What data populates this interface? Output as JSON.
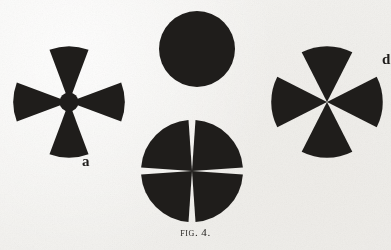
{
  "plate": {
    "caption_prefix": "Fig.",
    "caption_number": "4.",
    "caption_full": "FIG. 4.",
    "background_color": "#f2f1ee",
    "ink_color": "#1f1d1b"
  },
  "figures": [
    {
      "id": "a",
      "label": "a",
      "name": "four-sector-narrow-cross",
      "description": "Maltese-cross figure of four narrow circular sectors on the vertical and horizontal axes",
      "sector_count": 4,
      "sector_angle_deg": 40,
      "orientation_deg": 0,
      "center_x": 69,
      "center_y": 102,
      "radius": 54,
      "fill": "#1f1d1b"
    },
    {
      "id": "b",
      "label": "b",
      "name": "four-sector-wide-cross",
      "description": "Cross figure of four wide circular sectors meeting at a point on the vertical and horizontal axes",
      "sector_count": 4,
      "sector_angle_deg": 54,
      "orientation_deg": 0,
      "center_x": 327,
      "center_y": 102,
      "radius": 54,
      "fill": "#1f1d1b"
    },
    {
      "id": "c",
      "label": "c",
      "name": "four-quadrant-disc",
      "description": "Disc divided into four quadrant sectors separated by narrow white radial gaps",
      "sector_count": 4,
      "sector_angle_deg": 82,
      "orientation_deg": 45,
      "center_x": 192,
      "center_y": 171,
      "radius": 49,
      "fill": "#1f1d1b"
    },
    {
      "id": "d",
      "label": "d",
      "name": "solid-disc",
      "description": "Solid filled circle",
      "sector_count": 1,
      "sector_angle_deg": 360,
      "orientation_deg": 0,
      "center_x": 196,
      "center_y": 48,
      "radius": 38,
      "fill": "#1f1d1b"
    }
  ]
}
